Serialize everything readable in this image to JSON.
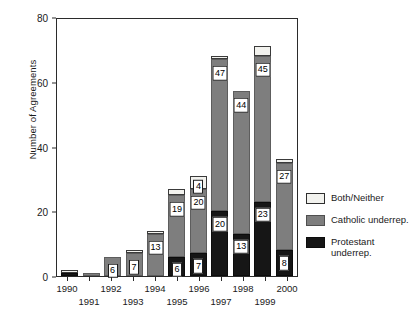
{
  "chart_data": {
    "type": "bar",
    "stacked": true,
    "title": "",
    "xlabel": "",
    "ylabel": "Number of Agreements",
    "ylim": [
      0,
      80
    ],
    "yticks": [
      0,
      20,
      40,
      60,
      80
    ],
    "grid": false,
    "legend_position": "right",
    "categories": [
      "1990",
      "1991",
      "1992",
      "1993",
      "1994",
      "1995",
      "1996",
      "1997",
      "1998",
      "1999",
      "2000"
    ],
    "series": [
      {
        "name": "Protestant underrep.",
        "color": "#161616",
        "values": [
          1,
          0,
          0,
          0,
          0,
          6,
          7,
          20,
          13,
          23,
          8
        ],
        "labels": [
          "",
          "",
          "",
          "",
          "",
          "6",
          "7",
          "20",
          "13",
          "23",
          "8"
        ]
      },
      {
        "name": "Catholic underrep.",
        "color": "#7e7e7e",
        "values": [
          0,
          1,
          6,
          7,
          13,
          19,
          20,
          47,
          44,
          45,
          27
        ],
        "labels": [
          "",
          "",
          "6",
          "7",
          "13",
          "19",
          "20",
          "47",
          "44",
          "45",
          "27"
        ]
      },
      {
        "name": "Both/Neither",
        "color": "#f2f2ee",
        "values": [
          1,
          0,
          0,
          1,
          1,
          2,
          4,
          1,
          0,
          3,
          1
        ],
        "labels": [
          "",
          "",
          "",
          "",
          "",
          "",
          "4",
          "",
          "",
          "",
          ""
        ]
      }
    ],
    "totals": [
      2,
      1,
      6,
      8,
      14,
      27,
      31,
      68,
      57,
      71,
      36
    ]
  },
  "axes": {
    "y_title": "Number of Agreements",
    "y_tick_labels": [
      "0",
      "20",
      "40",
      "60",
      "80"
    ],
    "x_tick_labels_top": [
      "1990",
      "1992",
      "1994",
      "1996",
      "1998",
      "2000"
    ],
    "x_tick_labels_bottom": [
      "1991",
      "1993",
      "1995",
      "1997",
      "1999"
    ]
  },
  "legend": {
    "items": [
      {
        "label": "Both/Neither",
        "label2": "",
        "swatch": "both-neither-swatch"
      },
      {
        "label": "Catholic underrep.",
        "label2": "",
        "swatch": "catholic-underrep-swatch"
      },
      {
        "label": "Protestant",
        "label2": "underrep.",
        "swatch": "protestant-underrep-swatch"
      }
    ]
  },
  "colors": {
    "both_neither": "#f2f2ee",
    "catholic": "#7e7e7e",
    "protestant": "#161616",
    "axis": "#2b2b2b",
    "background": "#ffffff"
  }
}
